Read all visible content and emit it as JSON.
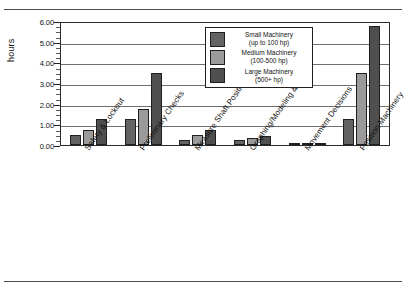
{
  "figure": {
    "top_ghost_text": "",
    "y_axis_title": "hours"
  },
  "legend": {
    "items": [
      {
        "name": "Small Machinery",
        "range": "(up to 100 hp)",
        "color": "#636363"
      },
      {
        "name": "Medium Machinery",
        "range": "(100-500 hp)",
        "color": "#9a9a9a"
      },
      {
        "name": "Large Machinery",
        "range": "(500+ hp)",
        "color": "#4f4f4f"
      }
    ]
  },
  "chart_data": {
    "type": "bar",
    "title": "",
    "xlabel": "",
    "ylabel": "hours",
    "ylim": [
      0,
      6
    ],
    "ytick_labels": [
      "0.00",
      "1.00",
      "2.00",
      "3.00",
      "4.00",
      "5.00",
      "6.00"
    ],
    "ytick_values": [
      0,
      1,
      2,
      3,
      4,
      5,
      6
    ],
    "grid": true,
    "legend_position": "upper center",
    "categories": [
      "Safety & Lockout",
      "Preliminary Checks",
      "Measure Shaft Positions",
      "Graphing/Modeling & Math",
      "Movement Decisions",
      "Position Machinery"
    ],
    "series": [
      {
        "name": "Small Machinery (up to 100 hp)",
        "color": "#636363",
        "values": [
          0.5,
          1.25,
          0.25,
          0.25,
          0.1,
          1.25
        ]
      },
      {
        "name": "Medium Machinery (100-500 hp)",
        "color": "#9a9a9a",
        "values": [
          0.75,
          1.75,
          0.5,
          0.33,
          0.1,
          3.5
        ]
      },
      {
        "name": "Large Machinery (500+ hp)",
        "color": "#4f4f4f",
        "values": [
          1.25,
          3.5,
          0.75,
          0.42,
          0.1,
          5.75
        ]
      }
    ]
  }
}
